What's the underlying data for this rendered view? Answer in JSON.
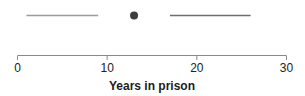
{
  "figure": {
    "background_color": "#ffffff"
  },
  "chart_data": {
    "type": "scatter",
    "title": "",
    "xlabel": "Years in prison",
    "ylabel": "",
    "xlim": [
      0,
      30
    ],
    "x_ticks": [
      0,
      10,
      20,
      30
    ],
    "grid": false,
    "legend": null,
    "point": {
      "x": 13,
      "color": "#3e3e3e",
      "radius_px": 4
    },
    "segments": [
      {
        "x_start": 1,
        "x_end": 9,
        "color": "#9c9c9c"
      },
      {
        "x_start": 17,
        "x_end": 26,
        "color": "#6e6e6e"
      }
    ],
    "axis_color": "#8a8a8a",
    "tick_label_color": "#222222"
  }
}
